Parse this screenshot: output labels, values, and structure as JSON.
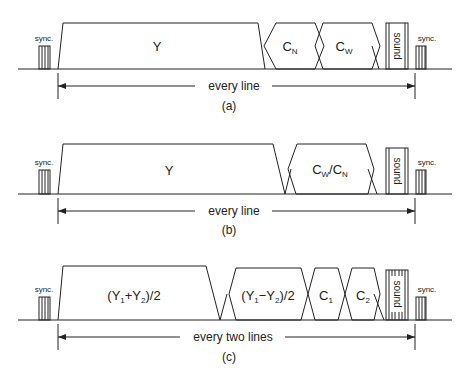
{
  "diagram": {
    "panels": [
      {
        "id": "a",
        "caption": "(a)",
        "span_label": "every line",
        "sync_label": "sync.",
        "components": [
          {
            "label": "Y",
            "sub": ""
          },
          {
            "label": "C",
            "sub": "N"
          },
          {
            "label": "C",
            "sub": "W"
          },
          {
            "label": "sound",
            "sub": ""
          }
        ]
      },
      {
        "id": "b",
        "caption": "(b)",
        "span_label": "every line",
        "sync_label": "sync.",
        "components": [
          {
            "label": "Y",
            "sub": ""
          },
          {
            "label": "C_W/C_N",
            "sub": ""
          },
          {
            "label": "sound",
            "sub": ""
          }
        ]
      },
      {
        "id": "c",
        "caption": "(c)",
        "span_label": "every two lines",
        "sync_label": "sync.",
        "components": [
          {
            "label": "(Y1+Y2)/2",
            "sub": ""
          },
          {
            "label": "(Y1-Y2)/2",
            "sub": ""
          },
          {
            "label": "C",
            "sub": "1"
          },
          {
            "label": "C",
            "sub": "2"
          },
          {
            "label": "sound",
            "sub": ""
          }
        ]
      }
    ],
    "text": {
      "a_Y": "Y",
      "a_CN": "C",
      "a_CN_sub": "N",
      "a_CW": "C",
      "a_CW_sub": "W",
      "sound": "sound",
      "sync": "sync.",
      "b_Y": "Y",
      "b_CW": "C",
      "b_CW_sub": "W",
      "b_slash": "/C",
      "b_CN_sub": "N",
      "c_sum_a": "(Y",
      "c_sum_sub1": "1",
      "c_sum_b": "+Y",
      "c_sum_sub2": "2",
      "c_sum_c": ")/2",
      "c_diff_a": "(Y",
      "c_diff_sub1": "1",
      "c_diff_b": "−Y",
      "c_diff_sub2": "2",
      "c_diff_c": ")/2",
      "c_C1": "C",
      "c_C1_sub": "1",
      "c_C2": "C",
      "c_C2_sub": "2",
      "every_line": "every line",
      "every_two_lines": "every two lines",
      "cap_a": "(a)",
      "cap_b": "(b)",
      "cap_c": "(c)"
    }
  }
}
